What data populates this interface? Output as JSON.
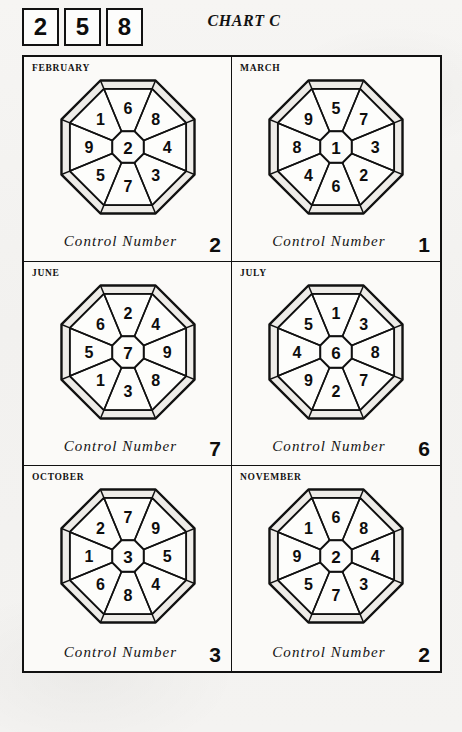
{
  "header": {
    "title": "CHART C",
    "digit_boxes": [
      "2",
      "5",
      "8"
    ]
  },
  "labels": {
    "control_number": "Control Number"
  },
  "chart_data": {
    "type": "diagram",
    "title": "CHART C",
    "key_digits": [
      "2",
      "5",
      "8"
    ],
    "cells": [
      {
        "month": "FEBRUARY",
        "center": "2",
        "wedges_clockwise_from_top": [
          "6",
          "8",
          "4",
          "3",
          "7",
          "5",
          "9",
          "1"
        ],
        "control_number": "2"
      },
      {
        "month": "MARCH",
        "center": "1",
        "wedges_clockwise_from_top": [
          "5",
          "7",
          "3",
          "2",
          "6",
          "4",
          "8",
          "9"
        ],
        "control_number": "1"
      },
      {
        "month": "JUNE",
        "center": "7",
        "wedges_clockwise_from_top": [
          "2",
          "4",
          "9",
          "8",
          "3",
          "1",
          "5",
          "6"
        ],
        "control_number": "7"
      },
      {
        "month": "JULY",
        "center": "6",
        "wedges_clockwise_from_top": [
          "1",
          "3",
          "8",
          "7",
          "2",
          "9",
          "4",
          "5"
        ],
        "control_number": "6"
      },
      {
        "month": "OCTOBER",
        "center": "3",
        "wedges_clockwise_from_top": [
          "7",
          "9",
          "5",
          "4",
          "8",
          "6",
          "1",
          "2"
        ],
        "control_number": "3"
      },
      {
        "month": "NOVEMBER",
        "center": "2",
        "wedges_clockwise_from_top": [
          "6",
          "8",
          "4",
          "3",
          "7",
          "5",
          "9",
          "1"
        ],
        "control_number": "2"
      }
    ]
  },
  "colors": {
    "ink": "#111111",
    "paper": "#f4f3f1",
    "cell_fill": "#fbfaf8"
  }
}
